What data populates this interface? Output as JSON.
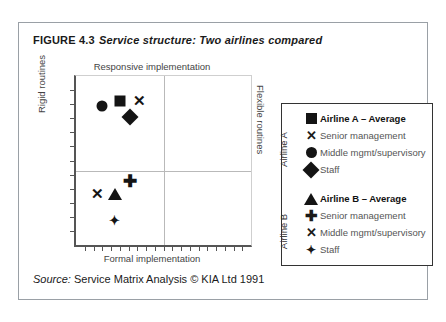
{
  "figure": {
    "number": "FIGURE 4.3",
    "title": "Service structure: Two airlines compared",
    "source_label": "Source:",
    "source_text": "Service Matrix Analysis © KIA Ltd 1991"
  },
  "chart_data": {
    "type": "scatter",
    "title": "Service structure: Two airlines compared",
    "xlabel": "Formal implementation",
    "ylabel": "Rigid routines",
    "axis_labels": {
      "top": "Responsive implementation",
      "bottom": "Formal implementation",
      "left": "Rigid routines",
      "right": "Flexible routines"
    },
    "xlim": [
      0,
      100
    ],
    "ylim": [
      0,
      100
    ],
    "grid": false,
    "quadrant_lines": {
      "x": 50,
      "y": 56
    },
    "legend_position": "right",
    "series": [
      {
        "name": "Airline A",
        "points": [
          {
            "label": "Airline A – Average",
            "marker": "square",
            "x": 25,
            "y": 85
          },
          {
            "label": "Senior management",
            "marker": "x",
            "x": 36,
            "y": 86
          },
          {
            "label": "Middle mgmt/supervisory",
            "marker": "circle",
            "x": 15,
            "y": 82
          },
          {
            "label": "Staff",
            "marker": "diamond",
            "x": 31,
            "y": 76
          }
        ]
      },
      {
        "name": "Airline B",
        "points": [
          {
            "label": "Airline B – Average",
            "marker": "triangle",
            "x": 22,
            "y": 30
          },
          {
            "label": "Senior management",
            "marker": "plus",
            "x": 31,
            "y": 38
          },
          {
            "label": "Middle mgmt/supervisory",
            "marker": "x",
            "x": 12,
            "y": 31
          },
          {
            "label": "Staff",
            "marker": "star4",
            "x": 22,
            "y": 15
          }
        ]
      }
    ]
  },
  "legend": {
    "group_a_label": "Airline A",
    "group_b_label": "Airline B",
    "rows_a": [
      {
        "marker": "square",
        "text": "Airline A – Average",
        "bold": true
      },
      {
        "marker": "x",
        "text": "Senior management",
        "bold": false
      },
      {
        "marker": "circle",
        "text": "Middle mgmt/supervisory",
        "bold": false
      },
      {
        "marker": "diamond",
        "text": "Staff",
        "bold": false
      }
    ],
    "rows_b": [
      {
        "marker": "triangle",
        "text": "Airline B – Average",
        "bold": true
      },
      {
        "marker": "plus",
        "text": "Senior management",
        "bold": false
      },
      {
        "marker": "x",
        "text": "Middle mgmt/supervisory",
        "bold": false
      },
      {
        "marker": "star4",
        "text": "Staff",
        "bold": false
      }
    ]
  },
  "glyphs": {
    "x": "✕",
    "plus": "✚",
    "star4": "✦"
  },
  "colors": {
    "ink": "#141414",
    "axis": "#555555",
    "quadrant": "#b9b9b9",
    "border": "#9aa0a6"
  }
}
